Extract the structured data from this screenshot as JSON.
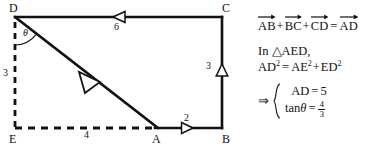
{
  "figure": {
    "type": "geometry-vector-diagram",
    "background_color": "#ffffff",
    "stroke_color": "#111111",
    "vertices": [
      {
        "name": "D",
        "label": "D",
        "x": 15,
        "y": 17
      },
      {
        "name": "C",
        "label": "C",
        "x": 222,
        "y": 17
      },
      {
        "name": "B",
        "label": "B",
        "x": 222,
        "y": 128
      },
      {
        "name": "A",
        "label": "A",
        "x": 158,
        "y": 128
      },
      {
        "name": "E",
        "label": "E",
        "x": 15,
        "y": 128
      }
    ],
    "edges": [
      {
        "name": "DC",
        "from": "D",
        "to": "C",
        "style": "solid",
        "length_label": "6",
        "arrow_direction": "left"
      },
      {
        "name": "CB",
        "from": "C",
        "to": "B",
        "style": "solid",
        "length_label": "3",
        "arrow_direction": "up"
      },
      {
        "name": "AB",
        "from": "A",
        "to": "B",
        "style": "solid",
        "length_label": "2",
        "arrow_direction": "right"
      },
      {
        "name": "DA",
        "from": "D",
        "to": "A",
        "style": "solid",
        "length_label": "",
        "arrow_direction": "down-right"
      },
      {
        "name": "DE",
        "from": "D",
        "to": "E",
        "style": "dashed",
        "length_label": "3",
        "arrow_direction": "none"
      },
      {
        "name": "EA",
        "from": "E",
        "to": "A",
        "style": "dashed",
        "length_label": "4",
        "arrow_direction": "none"
      }
    ],
    "angle": {
      "name": "theta",
      "label": "θ",
      "at_vertex": "D",
      "between": [
        "DE",
        "DA"
      ]
    }
  },
  "equations": {
    "vector_sum": {
      "terms": [
        "AB",
        "BC",
        "CD"
      ],
      "plus": "+",
      "equals": "=",
      "result": "AD"
    },
    "triangle_line": {
      "in_word": "In",
      "triangle_symbol": "△",
      "triangle_name": "AED",
      "comma": ","
    },
    "pythagoras": {
      "lhs_base": "AD",
      "lhs_exp": "2",
      "equals": "=",
      "t1_base": "AE",
      "t1_exp": "2",
      "plus": "+",
      "t2_base": "ED",
      "t2_exp": "2"
    },
    "results": {
      "implies_symbol": "⇒",
      "rows": [
        {
          "name": "AD-result",
          "lhs": "AD",
          "equals": "=",
          "value": "5",
          "is_fraction": false
        },
        {
          "name": "tan-theta-result",
          "lhs_prefix": "tan",
          "lhs_symbol": "θ",
          "equals": "=",
          "numerator": "4",
          "denominator": "3",
          "is_fraction": true
        }
      ]
    }
  }
}
